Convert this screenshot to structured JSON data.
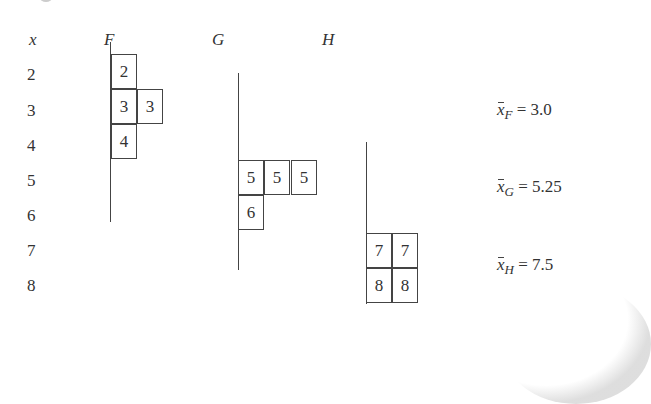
{
  "diagram": {
    "axis_label": "x",
    "row_values": [
      "2",
      "3",
      "4",
      "5",
      "6",
      "7",
      "8"
    ],
    "groups": [
      {
        "name": "F",
        "cells": [
          {
            "row": 2,
            "col": 0,
            "value": "2"
          },
          {
            "row": 3,
            "col": 0,
            "value": "3"
          },
          {
            "row": 3,
            "col": 1,
            "value": "3"
          },
          {
            "row": 4,
            "col": 0,
            "value": "4"
          }
        ],
        "mean_label": "x̄",
        "mean_subscript": "F",
        "mean_value": "= 3.0"
      },
      {
        "name": "G",
        "cells": [
          {
            "row": 5,
            "col": 0,
            "value": "5"
          },
          {
            "row": 5,
            "col": 1,
            "value": "5"
          },
          {
            "row": 5,
            "col": 2,
            "value": "5"
          },
          {
            "row": 6,
            "col": 0,
            "value": "6"
          }
        ],
        "mean_label": "x̄",
        "mean_subscript": "G",
        "mean_value": "= 5.25"
      },
      {
        "name": "H",
        "cells": [
          {
            "row": 7,
            "col": 0,
            "value": "7"
          },
          {
            "row": 7,
            "col": 1,
            "value": "7"
          },
          {
            "row": 8,
            "col": 0,
            "value": "8"
          },
          {
            "row": 8,
            "col": 1,
            "value": "8"
          }
        ],
        "mean_label": "x̄",
        "mean_subscript": "H",
        "mean_value": "= 7.5"
      }
    ]
  }
}
